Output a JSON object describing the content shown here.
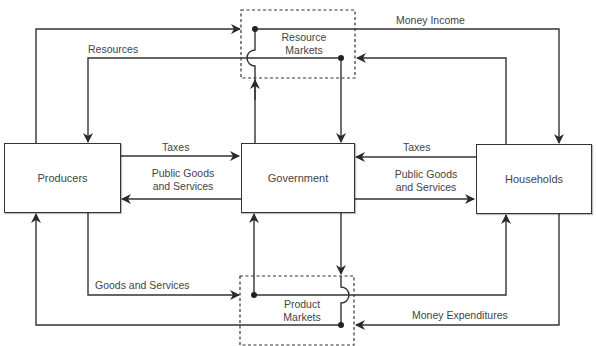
{
  "diagram": {
    "type": "circular-flow",
    "nodes": {
      "producers": {
        "label": "Producers"
      },
      "government": {
        "label": "Government"
      },
      "households": {
        "label": "Households"
      },
      "resource_markets": {
        "label_line1": "Resource",
        "label_line2": "Markets"
      },
      "product_markets": {
        "label_line1": "Product",
        "label_line2": "Markets"
      }
    },
    "flows": {
      "money_income": {
        "label": "Money Income",
        "from": "Resource Markets",
        "to": "Households"
      },
      "resources": {
        "label": "Resources",
        "from": "Resource Markets",
        "to": "Producers"
      },
      "taxes_producers": {
        "label": "Taxes",
        "from": "Producers",
        "to": "Government"
      },
      "public_goods_producers": {
        "label_line1": "Public Goods",
        "label_line2": "and Services",
        "from": "Government",
        "to": "Producers"
      },
      "taxes_households": {
        "label": "Taxes",
        "from": "Households",
        "to": "Government"
      },
      "public_goods_households": {
        "label_line1": "Public Goods",
        "label_line2": "and Services",
        "from": "Government",
        "to": "Households"
      },
      "goods_and_services": {
        "label": "Goods and Services",
        "from": "Product Markets",
        "to": "Households"
      },
      "money_expenditures": {
        "label": "Money Expenditures",
        "from": "Households",
        "to": "Product Markets"
      }
    },
    "colors": {
      "line": "#333333",
      "text": "#444444",
      "background": "#ffffff"
    }
  }
}
